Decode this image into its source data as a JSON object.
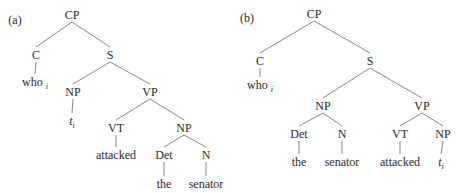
{
  "trees": [
    {
      "label": "(a)",
      "nodes": [
        {
          "id": "CP",
          "text": "CP"
        },
        {
          "id": "C",
          "text": "C"
        },
        {
          "id": "S",
          "text": "S"
        },
        {
          "id": "who",
          "text": "who",
          "sub": "i"
        },
        {
          "id": "NP1",
          "text": "NP"
        },
        {
          "id": "VP",
          "text": "VP"
        },
        {
          "id": "t",
          "text": "t",
          "sub": "i",
          "italic": true
        },
        {
          "id": "VT",
          "text": "VT"
        },
        {
          "id": "NP2",
          "text": "NP"
        },
        {
          "id": "attacked",
          "text": "attacked"
        },
        {
          "id": "Det",
          "text": "Det"
        },
        {
          "id": "N",
          "text": "N"
        },
        {
          "id": "the",
          "text": "the"
        },
        {
          "id": "senator",
          "text": "senator"
        }
      ],
      "edges": [
        [
          "CP",
          "C"
        ],
        [
          "CP",
          "S"
        ],
        [
          "C",
          "who"
        ],
        [
          "S",
          "NP1"
        ],
        [
          "S",
          "VP"
        ],
        [
          "NP1",
          "t"
        ],
        [
          "VP",
          "VT"
        ],
        [
          "VP",
          "NP2"
        ],
        [
          "VT",
          "attacked"
        ],
        [
          "NP2",
          "Det"
        ],
        [
          "NP2",
          "N"
        ],
        [
          "Det",
          "the"
        ],
        [
          "N",
          "senator"
        ]
      ]
    },
    {
      "label": "(b)",
      "nodes": [
        {
          "id": "CP",
          "text": "CP"
        },
        {
          "id": "C",
          "text": "C"
        },
        {
          "id": "S",
          "text": "S"
        },
        {
          "id": "who",
          "text": "who",
          "sub": "i"
        },
        {
          "id": "NP1",
          "text": "NP"
        },
        {
          "id": "VP",
          "text": "VP"
        },
        {
          "id": "Det",
          "text": "Det"
        },
        {
          "id": "N",
          "text": "N"
        },
        {
          "id": "VT",
          "text": "VT"
        },
        {
          "id": "NP2",
          "text": "NP"
        },
        {
          "id": "the",
          "text": "the"
        },
        {
          "id": "senator",
          "text": "senator"
        },
        {
          "id": "attacked",
          "text": "attacked"
        },
        {
          "id": "t",
          "text": "t",
          "sub": "i",
          "italic": true
        }
      ],
      "edges": [
        [
          "CP",
          "C"
        ],
        [
          "CP",
          "S"
        ],
        [
          "C",
          "who"
        ],
        [
          "S",
          "NP1"
        ],
        [
          "S",
          "VP"
        ],
        [
          "NP1",
          "Det"
        ],
        [
          "NP1",
          "N"
        ],
        [
          "Det",
          "the"
        ],
        [
          "N",
          "senator"
        ],
        [
          "VP",
          "VT"
        ],
        [
          "VP",
          "NP2"
        ],
        [
          "VT",
          "attacked"
        ],
        [
          "NP2",
          "t"
        ]
      ]
    }
  ]
}
